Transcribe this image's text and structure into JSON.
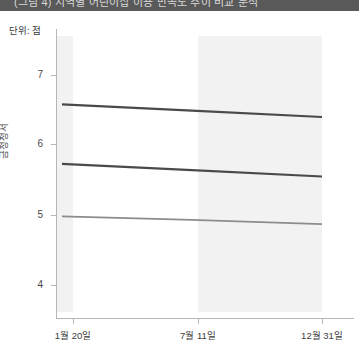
{
  "banner": {
    "text": "(그림 4) 지역별 어린이집 이용 만족도 추이 비교 분석"
  },
  "unit": {
    "label": "단위: 점"
  },
  "axis": {
    "y_title": "금정청서",
    "y_ticks": [
      "7",
      "6",
      "5",
      "4"
    ],
    "x_ticks": [
      "1월 20일",
      "7월 11일",
      "12월 31일"
    ]
  },
  "chart_data": {
    "type": "line",
    "title": "",
    "subtitle": "",
    "xlabel": "",
    "ylabel": "금정청서",
    "unit": "단위: 점",
    "x": [
      "1월 20일",
      "7월 11일",
      "12월 31일"
    ],
    "xtick_labels": [
      "1월 20일",
      "7월 11일",
      "12월 31일"
    ],
    "ytick_labels": [
      "4",
      "5",
      "6",
      "7"
    ],
    "ylim": [
      3.7,
      7.3
    ],
    "grid": false,
    "legend": "none",
    "shaded_regions": [
      {
        "from": "start",
        "to": "1월 20일",
        "color": "#f2f2f2"
      },
      {
        "from": "7월 11일",
        "to": "12월 31일",
        "color": "#f2f2f2"
      }
    ],
    "series": [
      {
        "name": "상위 집단",
        "color": "#4a4a4a",
        "width": 2.2,
        "values": [
          6.58,
          6.49,
          6.4
        ]
      },
      {
        "name": "중위 집단",
        "color": "#4a4a4a",
        "width": 2.2,
        "values": [
          5.73,
          5.64,
          5.55
        ]
      },
      {
        "name": "하위 집단",
        "color": "#8c8c8c",
        "width": 1.6,
        "values": [
          4.98,
          4.93,
          4.87
        ]
      }
    ]
  },
  "colors": {
    "banner_bg": "#595959",
    "axis": "#b6b6b6",
    "band": "#f2f2f2",
    "line_dark": "#4a4a4a",
    "line_light": "#8c8c8c"
  }
}
